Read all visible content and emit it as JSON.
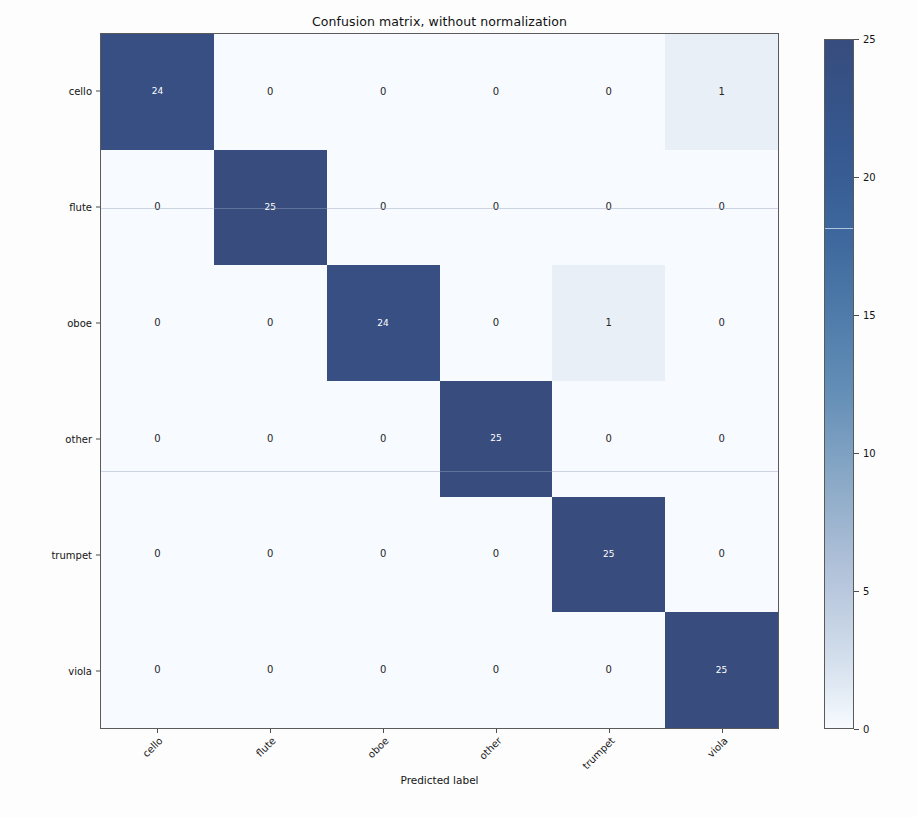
{
  "chart_data": {
    "type": "heatmap",
    "title": "Confusion matrix, without normalization",
    "xlabel": "Predicted label",
    "ylabel": "True label",
    "categories": [
      "cello",
      "flute",
      "oboe",
      "other",
      "trumpet",
      "viola"
    ],
    "row_labels": [
      "cello",
      "flute",
      "oboe",
      "other",
      "trumpet",
      "viola"
    ],
    "col_labels": [
      "cello",
      "flute",
      "oboe",
      "other",
      "trumpet",
      "viola"
    ],
    "values": [
      [
        24,
        0,
        0,
        0,
        0,
        1
      ],
      [
        0,
        25,
        0,
        0,
        0,
        0
      ],
      [
        0,
        0,
        24,
        0,
        1,
        0
      ],
      [
        0,
        0,
        0,
        25,
        0,
        0
      ],
      [
        0,
        0,
        0,
        0,
        25,
        0
      ],
      [
        0,
        0,
        0,
        0,
        0,
        25
      ]
    ],
    "colormap": "Blues",
    "vmin": 0,
    "vmax": 25,
    "grid": false,
    "legend": "colorbar-right",
    "colorbar": {
      "ticks": [
        25,
        20,
        15,
        10,
        5,
        0
      ],
      "min_label": "0",
      "max_label": "25"
    },
    "xtick_rotation": -45
  },
  "colors": {
    "cell_high": "#39487a",
    "cell_mid": "#4a5a8c",
    "cell_low": "#f7f8fa",
    "text_on_dark": "#ffffff",
    "text_on_light": "#262626",
    "axis_line": "#5a5a5a",
    "background": "#fdfdfd"
  }
}
